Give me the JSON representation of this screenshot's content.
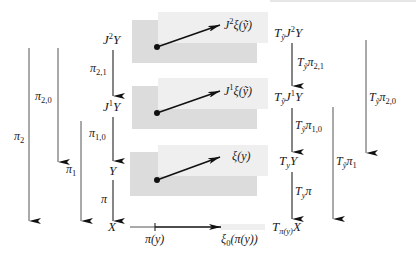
{
  "figure": {
    "left": {
      "nodes": {
        "j2y": {
          "base": "J",
          "sup": "2",
          "tail": "Y"
        },
        "j1y": {
          "base": "J",
          "sup": "1",
          "tail": "Y"
        },
        "y": "Y",
        "x": "X"
      },
      "maps": {
        "pi21": {
          "base": "π",
          "sub": "2,1"
        },
        "pi10": {
          "base": "π",
          "sub": "1,0"
        },
        "pi": "π",
        "pi20": {
          "base": "π",
          "sub": "2,0"
        },
        "pi2": {
          "base": "π",
          "sub": "2"
        },
        "pi1": {
          "base": "π",
          "sub": "1"
        }
      }
    },
    "middle": {
      "panels": [
        {
          "base": "J",
          "sup": "2",
          "tail": "ξ(ỹ)"
        },
        {
          "base": "J",
          "sup": "1",
          "tail": "ξ(ỹ)"
        },
        {
          "tail": "ξ(y)"
        }
      ],
      "base_point": "π(y)",
      "base_vector": {
        "base": "ξ",
        "sub": "0",
        "tail": "(π(y))"
      }
    },
    "right": {
      "nodes": {
        "t_j2y": {
          "T": "T",
          "sub": "ỹ",
          "base": "J",
          "sup": "2",
          "tail": "Y"
        },
        "t_j1y": {
          "T": "T",
          "sub": "ỹ",
          "base": "J",
          "sup": "1",
          "tail": "Y"
        },
        "t_y": {
          "T": "T",
          "sub": "y",
          "tail": "Y"
        },
        "t_x": {
          "T": "T",
          "sub": "π(y)",
          "tail": "X"
        }
      },
      "maps": {
        "t_pi21": {
          "T": "T",
          "sub": "ỹ",
          "base": "π",
          "sub2": "2,1"
        },
        "t_pi10": {
          "T": "T",
          "sub": "ỹ",
          "base": "π",
          "sub2": "1,0"
        },
        "t_pi": {
          "T": "T",
          "sub": "y",
          "base": "π"
        },
        "t_pi20": {
          "T": "T",
          "sub": "ỹ",
          "base": "π",
          "sub2": "2,0"
        },
        "t_pi1": {
          "T": "T",
          "sub": "ỹ",
          "base": "π",
          "sub2": "1"
        }
      }
    },
    "colors": {
      "line": "#222222",
      "thin_line": "#555555",
      "shade_light": "#efefef",
      "shade_dark": "#dcdcdc"
    }
  }
}
